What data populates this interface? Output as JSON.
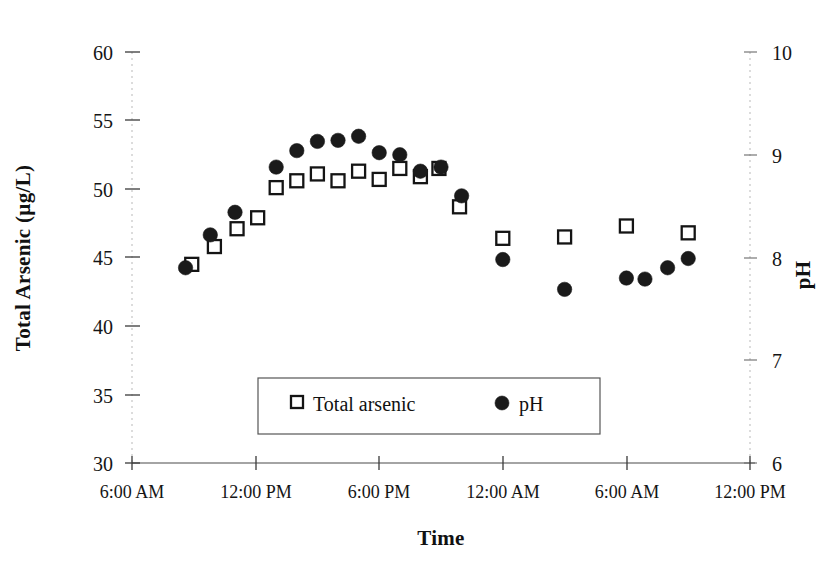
{
  "chart_data": {
    "type": "scatter",
    "title": "",
    "xlabel": "Time",
    "ylabel": "Total Arsenic (µg/L)",
    "y2label": "pH",
    "grid": false,
    "legend_position": "inside-bottom-center",
    "x_tick_labels": [
      "6:00 AM",
      "12:00 PM",
      "6:00 PM",
      "12:00 AM",
      "6:00 AM",
      "12:00 PM"
    ],
    "x_tick_hours": [
      6,
      12,
      18,
      24,
      30,
      36
    ],
    "xlim_hours": [
      6,
      36
    ],
    "y_tick_labels": [
      "30",
      "35",
      "40",
      "45",
      "50",
      "55",
      "60"
    ],
    "ylim": [
      30,
      60
    ],
    "y2_tick_labels": [
      "6",
      "7",
      "8",
      "9",
      "10"
    ],
    "y2lim": [
      6,
      10
    ],
    "series": [
      {
        "name": "Total arsenic",
        "key": "total_arsenic",
        "marker": "open-square",
        "axis": "left",
        "unit": "µg/L",
        "points": [
          {
            "hour": 8.9,
            "value": 44.5
          },
          {
            "hour": 10.0,
            "value": 45.8
          },
          {
            "hour": 11.1,
            "value": 47.1
          },
          {
            "hour": 12.1,
            "value": 47.9
          },
          {
            "hour": 13.0,
            "value": 50.1
          },
          {
            "hour": 14.0,
            "value": 50.6
          },
          {
            "hour": 15.0,
            "value": 51.1
          },
          {
            "hour": 16.0,
            "value": 50.6
          },
          {
            "hour": 17.0,
            "value": 51.3
          },
          {
            "hour": 18.0,
            "value": 50.7
          },
          {
            "hour": 19.0,
            "value": 51.5
          },
          {
            "hour": 20.0,
            "value": 50.9
          },
          {
            "hour": 20.9,
            "value": 51.5
          },
          {
            "hour": 21.9,
            "value": 48.7
          },
          {
            "hour": 24.0,
            "value": 46.4
          },
          {
            "hour": 27.0,
            "value": 46.5
          },
          {
            "hour": 30.0,
            "value": 47.3
          },
          {
            "hour": 33.0,
            "value": 46.8
          }
        ]
      },
      {
        "name": "pH",
        "key": "ph",
        "marker": "filled-circle",
        "axis": "right",
        "unit": "",
        "points": [
          {
            "hour": 8.6,
            "value": 7.9
          },
          {
            "hour": 9.8,
            "value": 8.22
          },
          {
            "hour": 11.0,
            "value": 8.44
          },
          {
            "hour": 13.0,
            "value": 8.88
          },
          {
            "hour": 14.0,
            "value": 9.04
          },
          {
            "hour": 15.0,
            "value": 9.13
          },
          {
            "hour": 16.0,
            "value": 9.14
          },
          {
            "hour": 17.0,
            "value": 9.18
          },
          {
            "hour": 18.0,
            "value": 9.02
          },
          {
            "hour": 19.0,
            "value": 9.0
          },
          {
            "hour": 20.0,
            "value": 8.84
          },
          {
            "hour": 21.0,
            "value": 8.88
          },
          {
            "hour": 22.0,
            "value": 8.6
          },
          {
            "hour": 24.0,
            "value": 7.98
          },
          {
            "hour": 27.0,
            "value": 7.69
          },
          {
            "hour": 30.0,
            "value": 7.8
          },
          {
            "hour": 30.9,
            "value": 7.79
          },
          {
            "hour": 32.0,
            "value": 7.9
          },
          {
            "hour": 33.0,
            "value": 7.99
          }
        ]
      }
    ],
    "legend_entries": [
      {
        "label": "Total arsenic",
        "marker": "open-square"
      },
      {
        "label": "pH",
        "marker": "filled-circle"
      }
    ]
  }
}
